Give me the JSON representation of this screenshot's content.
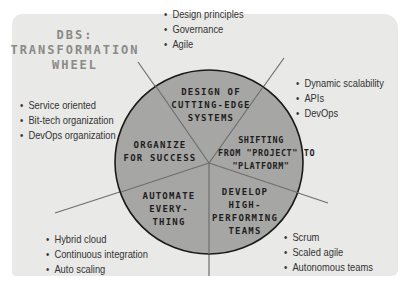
{
  "title": {
    "line1": "DBS:",
    "line2": "TRANSFORMATION",
    "line3": "WHEEL"
  },
  "colors": {
    "card": "#e9e9e7",
    "wheel_fill": "#a6a6a4",
    "wheel_stroke": "#1a1a1a",
    "spoke": "#6e6e6e"
  },
  "segments": [
    {
      "lines": [
        "DESIGN OF",
        "CUTTING-EDGE",
        "SYSTEMS"
      ],
      "bullets": [
        "Design principles",
        "Governance",
        "Agile"
      ]
    },
    {
      "lines": [
        "SHIFTING",
        "FROM \"PROJECT\" TO",
        "\"PLATFORM\""
      ],
      "bullets": [
        "Dynamic scalability",
        "APIs",
        "DevOps"
      ]
    },
    {
      "lines": [
        "DEVELOP",
        "HIGH-",
        "PERFORMING",
        "TEAMS"
      ],
      "bullets": [
        "Scrum",
        "Scaled agile",
        "Autonomous teams"
      ]
    },
    {
      "lines": [
        "AUTOMATE",
        "EVERY-",
        "THING"
      ],
      "bullets": [
        "Hybrid cloud",
        "Continuous integration",
        "Auto scaling"
      ]
    },
    {
      "lines": [
        "ORGANIZE",
        "FOR SUCCESS"
      ],
      "bullets": [
        "Service oriented",
        "Bit-tech organization",
        "DevOps organization"
      ]
    }
  ]
}
